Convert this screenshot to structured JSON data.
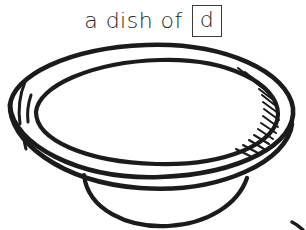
{
  "caption": {
    "text": "a dish of",
    "boxed_letter": "d"
  },
  "colors": {
    "background": "#ffffff",
    "ink": "#1b1b1b",
    "text": "#262626",
    "box_border": "#3a3a3a"
  },
  "illustration": {
    "subject": "dish",
    "style": "black-ink line drawing",
    "parts": [
      "outer-rim-oval",
      "inner-rim-oval",
      "bowl-wall",
      "pedestal-foot",
      "hatching-shading-right",
      "highlight-ticks-left"
    ]
  }
}
